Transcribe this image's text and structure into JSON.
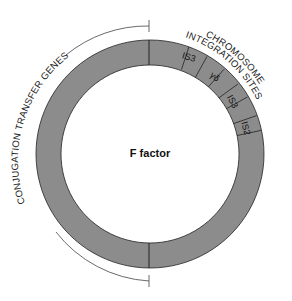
{
  "diagram": {
    "title": "F factor",
    "ring_color": "#8c8c8c",
    "stroke_color": "#222222",
    "labels": {
      "conjugation": "CONJUGATION TRANSFER GENES",
      "chromosome_line1": "CHROMOSOME",
      "chromosome_line2": "INTEGRATION SITES"
    },
    "segments": [
      {
        "label": "IS3"
      },
      {
        "label": "γδ"
      },
      {
        "label": "IS3"
      },
      {
        "label": "IS2"
      }
    ]
  }
}
